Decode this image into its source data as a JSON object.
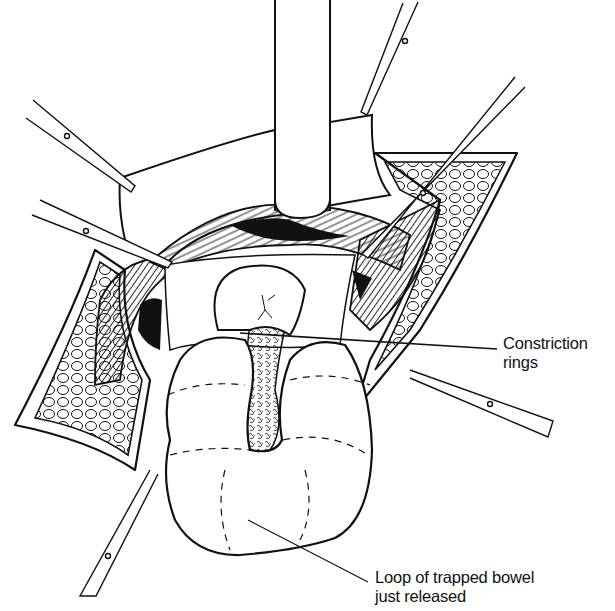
{
  "figure": {
    "colors": {
      "ink": "#111111",
      "background": "#ffffff"
    },
    "labels": [
      {
        "id": "constriction",
        "lines": [
          "Constriction",
          "rings"
        ]
      },
      {
        "id": "loop",
        "lines": [
          "Loop of trapped bowel",
          "just released"
        ]
      }
    ],
    "instruments": [
      {
        "type": "retractor-blade",
        "position": "top-center"
      },
      {
        "type": "forceps",
        "position": "upper-left"
      },
      {
        "type": "forceps",
        "position": "middle-left"
      },
      {
        "type": "forceps",
        "position": "top-right"
      },
      {
        "type": "forceps",
        "position": "upper-right-diagonal"
      },
      {
        "type": "forceps",
        "position": "right"
      },
      {
        "type": "forceps",
        "position": "lower-left"
      }
    ]
  }
}
